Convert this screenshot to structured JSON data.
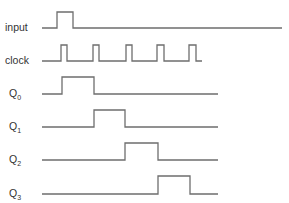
{
  "diagram": {
    "line_color": "#6e6e6e",
    "text_color": "#333333",
    "signals": [
      {
        "id": "input",
        "label": "input",
        "subscript": "",
        "label_x": 5,
        "label_y": 31,
        "low_y": 28,
        "high_y": 12,
        "points": [
          [
            42,
            28
          ],
          [
            57,
            28
          ],
          [
            57,
            12
          ],
          [
            73,
            12
          ],
          [
            73,
            28
          ],
          [
            282,
            28
          ]
        ]
      },
      {
        "id": "clock",
        "label": "clock",
        "subscript": "",
        "label_x": 5,
        "label_y": 64,
        "low_y": 61,
        "high_y": 45,
        "points": [
          [
            42,
            61
          ],
          [
            61,
            61
          ],
          [
            61,
            45
          ],
          [
            67,
            45
          ],
          [
            67,
            61
          ],
          [
            93,
            61
          ],
          [
            93,
            45
          ],
          [
            99,
            45
          ],
          [
            99,
            61
          ],
          [
            126,
            61
          ],
          [
            126,
            45
          ],
          [
            132,
            45
          ],
          [
            132,
            61
          ],
          [
            157,
            61
          ],
          [
            157,
            45
          ],
          [
            164,
            45
          ],
          [
            164,
            61
          ],
          [
            189,
            61
          ],
          [
            189,
            45
          ],
          [
            196,
            45
          ],
          [
            196,
            61
          ],
          [
            202,
            61
          ]
        ]
      },
      {
        "id": "q0",
        "label": "Q",
        "subscript": "0",
        "label_x": 9,
        "label_y": 97,
        "low_y": 94,
        "high_y": 77,
        "points": [
          [
            42,
            94
          ],
          [
            62,
            94
          ],
          [
            62,
            77
          ],
          [
            94,
            77
          ],
          [
            94,
            94
          ],
          [
            218,
            94
          ]
        ]
      },
      {
        "id": "q1",
        "label": "Q",
        "subscript": "1",
        "label_x": 9,
        "label_y": 130,
        "low_y": 127,
        "high_y": 110,
        "points": [
          [
            42,
            127
          ],
          [
            94,
            127
          ],
          [
            94,
            110
          ],
          [
            125,
            110
          ],
          [
            125,
            127
          ],
          [
            218,
            127
          ]
        ]
      },
      {
        "id": "q2",
        "label": "Q",
        "subscript": "2",
        "label_x": 9,
        "label_y": 163,
        "low_y": 160,
        "high_y": 143,
        "points": [
          [
            42,
            160
          ],
          [
            125,
            160
          ],
          [
            125,
            143
          ],
          [
            158,
            143
          ],
          [
            158,
            160
          ],
          [
            218,
            160
          ]
        ]
      },
      {
        "id": "q3",
        "label": "Q",
        "subscript": "3",
        "label_x": 9,
        "label_y": 197,
        "low_y": 194,
        "high_y": 176,
        "points": [
          [
            42,
            194
          ],
          [
            158,
            194
          ],
          [
            158,
            176
          ],
          [
            190,
            176
          ],
          [
            190,
            194
          ],
          [
            218,
            194
          ]
        ]
      }
    ]
  }
}
